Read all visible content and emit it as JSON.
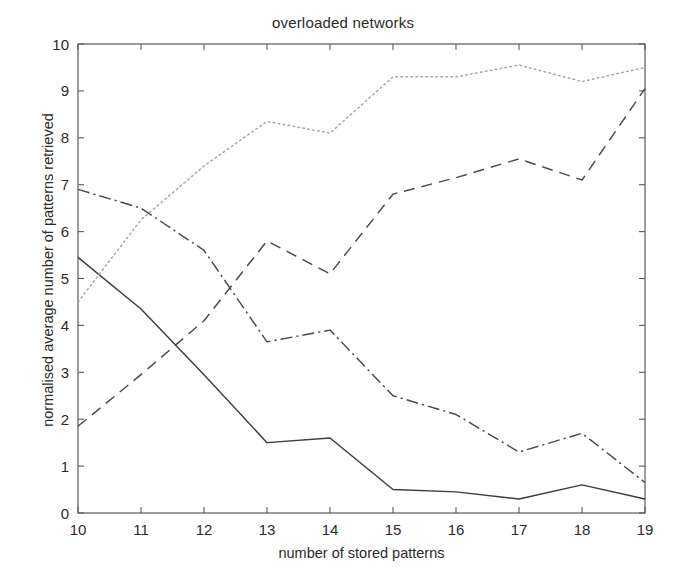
{
  "figure": {
    "title": "overloaded networks",
    "xlabel": "number of stored patterns",
    "ylabel": "normalised average number of patterns retrieved"
  },
  "chart_data": {
    "type": "line",
    "title": "overloaded networks",
    "xlabel": "number of stored patterns",
    "ylabel": "normalised average number of patterns retrieved",
    "xlim": [
      10,
      19
    ],
    "ylim": [
      0,
      10
    ],
    "xticks": [
      10,
      11,
      12,
      13,
      14,
      15,
      16,
      17,
      18,
      19
    ],
    "yticks": [
      0,
      1,
      2,
      3,
      4,
      5,
      6,
      7,
      8,
      9,
      10
    ],
    "grid": false,
    "legend": "none",
    "x": [
      10,
      11,
      12,
      13,
      14,
      15,
      16,
      17,
      18,
      19
    ],
    "series": [
      {
        "name": "solid",
        "linestyle": "solid",
        "color": "#3c3c3c",
        "values": [
          5.45,
          4.35,
          2.95,
          1.5,
          1.6,
          0.5,
          0.45,
          0.3,
          0.6,
          0.3
        ]
      },
      {
        "name": "dashed",
        "linestyle": "dashed",
        "color": "#4a4a4a",
        "values": [
          1.85,
          2.95,
          4.1,
          5.8,
          5.1,
          6.8,
          7.15,
          7.55,
          7.1,
          9.05
        ]
      },
      {
        "name": "dash-dot",
        "linestyle": "dashdot",
        "color": "#4a4a4a",
        "values": [
          6.9,
          6.5,
          5.6,
          3.65,
          3.9,
          2.5,
          2.1,
          1.3,
          1.7,
          0.65
        ]
      },
      {
        "name": "dotted",
        "linestyle": "dotted",
        "color": "#a8a8a8",
        "values": [
          4.5,
          6.25,
          7.4,
          8.35,
          8.1,
          9.3,
          9.3,
          9.55,
          9.2,
          9.5
        ]
      }
    ]
  },
  "axes": {
    "x_tick_labels": [
      "10",
      "11",
      "12",
      "13",
      "14",
      "15",
      "16",
      "17",
      "18",
      "19"
    ],
    "y_tick_labels": [
      "0",
      "1",
      "2",
      "3",
      "4",
      "5",
      "6",
      "7",
      "8",
      "9",
      "10"
    ]
  }
}
